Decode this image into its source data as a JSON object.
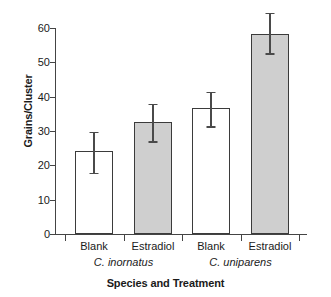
{
  "chart_data": {
    "type": "bar",
    "title": "",
    "xlabel": "Species and Treatment",
    "ylabel": "Grains/Cluster",
    "ylim": [
      0,
      60
    ],
    "yticks": [
      0,
      10,
      20,
      30,
      40,
      50,
      60
    ],
    "grid": false,
    "legend": null,
    "categories": [
      "Blank",
      "Estradiol",
      "Blank",
      "Estradiol"
    ],
    "groups": [
      {
        "name": "C. inornatus",
        "italic": true,
        "categories": [
          "Blank",
          "Estradiol"
        ]
      },
      {
        "name": "C. uniparens",
        "italic": true,
        "categories": [
          "Blank",
          "Estradiol"
        ]
      }
    ],
    "values": [
      24.2,
      32.7,
      36.8,
      58.3
    ],
    "errors_upper": [
      29.8,
      38.0,
      41.5,
      64.5
    ],
    "errors_lower": [
      17.8,
      27.1,
      31.4,
      52.6
    ],
    "bar_styles": [
      "open",
      "filled",
      "open",
      "filled"
    ],
    "colors": {
      "open_fill": "#ffffff",
      "filled_fill": "#cfcfcf",
      "bar_outline": "#3b3b3b",
      "axis": "#444444",
      "error_bar": "#4a4a4a",
      "background": "#ffffff",
      "text": "#1a1a1a"
    }
  },
  "axis": {
    "y_tick_labels": [
      "0",
      "10",
      "20",
      "30",
      "40",
      "50",
      "60"
    ],
    "y_title": "Grains/Cluster",
    "x_title": "Species and Treatment"
  },
  "bars": [
    {
      "label": "Blank",
      "group": "C. inornatus",
      "value": 24.2,
      "hi": 29.8,
      "lo": 17.8,
      "style": "open"
    },
    {
      "label": "Estradiol",
      "group": "C. inornatus",
      "value": 32.7,
      "hi": 38.0,
      "lo": 27.1,
      "style": "filled"
    },
    {
      "label": "Blank",
      "group": "C. uniparens",
      "value": 36.8,
      "hi": 41.5,
      "lo": 31.4,
      "style": "open"
    },
    {
      "label": "Estradiol",
      "group": "C. uniparens",
      "value": 58.3,
      "hi": 64.5,
      "lo": 52.6,
      "style": "filled"
    }
  ],
  "groups": [
    {
      "name": "C. inornatus"
    },
    {
      "name": "C. uniparens"
    }
  ]
}
